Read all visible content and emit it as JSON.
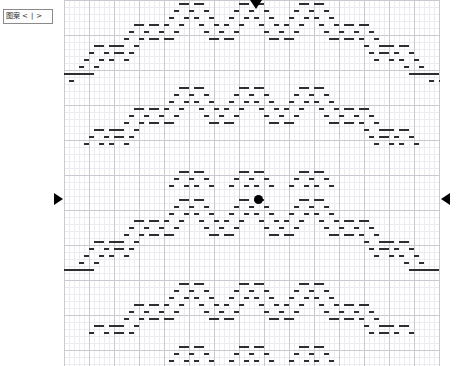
{
  "panel": {
    "pattern_nav": {
      "label": "图案",
      "prev": "<",
      "sep": "|",
      "next": ">"
    }
  },
  "chart": {
    "title": "",
    "grid": {
      "cell_width_px": 5,
      "cell_height_px": 7,
      "major_every_cells": 5,
      "minor_color": "#ececf0",
      "major_color": "#c9c9cf",
      "background": "#ffffff",
      "origin_x_px": 64,
      "origin_y_px": 0,
      "width_px": 376,
      "height_px": 366,
      "cols": 75,
      "rows": 52
    },
    "stitch": {
      "color": "#2e2e32",
      "shape": "horizontal-dash",
      "width_px": 5,
      "height_px": 2
    },
    "markers": {
      "top": {
        "icon": "triangle-down",
        "color": "#000000",
        "x_px": 256,
        "y_px": 5
      },
      "left": {
        "icon": "triangle-right",
        "color": "#000000",
        "x_px": 58,
        "y_px": 199
      },
      "right": {
        "icon": "triangle-left",
        "color": "#000000",
        "x_px": 445,
        "y_px": 199
      },
      "center": {
        "icon": "center-dot",
        "color": "#000000",
        "x_px": 258,
        "y_px": 199
      }
    }
  },
  "chart_data": {
    "type": "heatmap",
    "xlabel": "",
    "ylabel": "",
    "grid": true,
    "legend": "none",
    "cols": 75,
    "rows": 52,
    "symbol": "horizontal-dash",
    "symbol_color": "#2e2e32",
    "filled_cells": [
      [
        26,
        0
      ],
      [
        27,
        0
      ],
      [
        38,
        0
      ],
      [
        39,
        0
      ],
      [
        50,
        0
      ],
      [
        51,
        0
      ],
      [
        25,
        1
      ],
      [
        28,
        1
      ],
      [
        37,
        1
      ],
      [
        40,
        1
      ],
      [
        49,
        1
      ],
      [
        52,
        1
      ],
      [
        24,
        2
      ],
      [
        29,
        2
      ],
      [
        36,
        2
      ],
      [
        41,
        2
      ],
      [
        48,
        2
      ],
      [
        53,
        2
      ],
      [
        17,
        3
      ],
      [
        18,
        3
      ],
      [
        23,
        3
      ],
      [
        30,
        3
      ],
      [
        35,
        3
      ],
      [
        42,
        3
      ],
      [
        47,
        3
      ],
      [
        54,
        3
      ],
      [
        59,
        3
      ],
      [
        60,
        3
      ],
      [
        16,
        4
      ],
      [
        19,
        4
      ],
      [
        22,
        4
      ],
      [
        31,
        4
      ],
      [
        34,
        4
      ],
      [
        43,
        4
      ],
      [
        46,
        4
      ],
      [
        55,
        4
      ],
      [
        58,
        4
      ],
      [
        61,
        4
      ],
      [
        15,
        5
      ],
      [
        20,
        5
      ],
      [
        21,
        5
      ],
      [
        32,
        5
      ],
      [
        33,
        5
      ],
      [
        44,
        5
      ],
      [
        45,
        5
      ],
      [
        56,
        5
      ],
      [
        57,
        5
      ],
      [
        62,
        5
      ],
      [
        9,
        6
      ],
      [
        10,
        6
      ],
      [
        14,
        6
      ],
      [
        63,
        6
      ],
      [
        67,
        6
      ],
      [
        68,
        6
      ],
      [
        8,
        7
      ],
      [
        11,
        7
      ],
      [
        13,
        7
      ],
      [
        64,
        7
      ],
      [
        66,
        7
      ],
      [
        69,
        7
      ],
      [
        7,
        8
      ],
      [
        12,
        8
      ],
      [
        65,
        8
      ],
      [
        70,
        8
      ],
      [
        6,
        9
      ],
      [
        71,
        9
      ],
      [
        2,
        10
      ],
      [
        3,
        10
      ],
      [
        4,
        10
      ],
      [
        5,
        10
      ],
      [
        72,
        10
      ],
      [
        73,
        10
      ],
      [
        74,
        10
      ],
      [
        1,
        11
      ],
      [
        75,
        11
      ],
      [
        26,
        12
      ],
      [
        27,
        12
      ],
      [
        38,
        12
      ],
      [
        39,
        12
      ],
      [
        50,
        12
      ],
      [
        51,
        12
      ],
      [
        25,
        13
      ],
      [
        28,
        13
      ],
      [
        37,
        13
      ],
      [
        40,
        13
      ],
      [
        49,
        13
      ],
      [
        52,
        13
      ],
      [
        24,
        14
      ],
      [
        29,
        14
      ],
      [
        36,
        14
      ],
      [
        41,
        14
      ],
      [
        48,
        14
      ],
      [
        53,
        14
      ],
      [
        17,
        15
      ],
      [
        18,
        15
      ],
      [
        23,
        15
      ],
      [
        30,
        15
      ],
      [
        35,
        15
      ],
      [
        42,
        15
      ],
      [
        47,
        15
      ],
      [
        54,
        15
      ],
      [
        59,
        15
      ],
      [
        60,
        15
      ],
      [
        16,
        16
      ],
      [
        19,
        16
      ],
      [
        22,
        16
      ],
      [
        31,
        16
      ],
      [
        34,
        16
      ],
      [
        43,
        16
      ],
      [
        46,
        16
      ],
      [
        55,
        16
      ],
      [
        58,
        16
      ],
      [
        61,
        16
      ],
      [
        15,
        17
      ],
      [
        20,
        17
      ],
      [
        21,
        17
      ],
      [
        32,
        17
      ],
      [
        33,
        17
      ],
      [
        44,
        17
      ],
      [
        45,
        17
      ],
      [
        56,
        17
      ],
      [
        57,
        17
      ],
      [
        62,
        17
      ],
      [
        9,
        18
      ],
      [
        10,
        18
      ],
      [
        14,
        18
      ],
      [
        63,
        18
      ],
      [
        67,
        18
      ],
      [
        68,
        18
      ],
      [
        8,
        19
      ],
      [
        11,
        19
      ],
      [
        13,
        19
      ],
      [
        64,
        19
      ],
      [
        66,
        19
      ],
      [
        69,
        19
      ],
      [
        7,
        20
      ],
      [
        12,
        20
      ],
      [
        65,
        20
      ],
      [
        70,
        20
      ],
      [
        26,
        24
      ],
      [
        27,
        24
      ],
      [
        38,
        24
      ],
      [
        39,
        24
      ],
      [
        50,
        24
      ],
      [
        51,
        24
      ],
      [
        25,
        25
      ],
      [
        28,
        25
      ],
      [
        37,
        25
      ],
      [
        40,
        25
      ],
      [
        49,
        25
      ],
      [
        52,
        25
      ],
      [
        24,
        26
      ],
      [
        29,
        26
      ],
      [
        36,
        26
      ],
      [
        41,
        26
      ],
      [
        48,
        26
      ],
      [
        53,
        26
      ],
      [
        26,
        28
      ],
      [
        27,
        28
      ],
      [
        38,
        28
      ],
      [
        39,
        28
      ],
      [
        50,
        28
      ],
      [
        51,
        28
      ],
      [
        25,
        29
      ],
      [
        28,
        29
      ],
      [
        37,
        29
      ],
      [
        40,
        29
      ],
      [
        49,
        29
      ],
      [
        52,
        29
      ],
      [
        24,
        30
      ],
      [
        29,
        30
      ],
      [
        36,
        30
      ],
      [
        41,
        30
      ],
      [
        48,
        30
      ],
      [
        53,
        30
      ],
      [
        17,
        31
      ],
      [
        18,
        31
      ],
      [
        23,
        31
      ],
      [
        30,
        31
      ],
      [
        35,
        31
      ],
      [
        42,
        31
      ],
      [
        47,
        31
      ],
      [
        54,
        31
      ],
      [
        59,
        31
      ],
      [
        60,
        31
      ],
      [
        16,
        32
      ],
      [
        19,
        32
      ],
      [
        22,
        32
      ],
      [
        31,
        32
      ],
      [
        34,
        32
      ],
      [
        43,
        32
      ],
      [
        46,
        32
      ],
      [
        55,
        32
      ],
      [
        58,
        32
      ],
      [
        61,
        32
      ],
      [
        15,
        33
      ],
      [
        20,
        33
      ],
      [
        21,
        33
      ],
      [
        32,
        33
      ],
      [
        33,
        33
      ],
      [
        44,
        33
      ],
      [
        45,
        33
      ],
      [
        56,
        33
      ],
      [
        57,
        33
      ],
      [
        62,
        33
      ],
      [
        9,
        34
      ],
      [
        10,
        34
      ],
      [
        14,
        34
      ],
      [
        63,
        34
      ],
      [
        67,
        34
      ],
      [
        68,
        34
      ],
      [
        8,
        35
      ],
      [
        11,
        35
      ],
      [
        13,
        35
      ],
      [
        64,
        35
      ],
      [
        66,
        35
      ],
      [
        69,
        35
      ],
      [
        7,
        36
      ],
      [
        12,
        36
      ],
      [
        65,
        36
      ],
      [
        70,
        36
      ],
      [
        6,
        37
      ],
      [
        71,
        37
      ],
      [
        2,
        38
      ],
      [
        3,
        38
      ],
      [
        4,
        38
      ],
      [
        5,
        38
      ],
      [
        72,
        38
      ],
      [
        73,
        38
      ],
      [
        74,
        38
      ],
      [
        26,
        40
      ],
      [
        27,
        40
      ],
      [
        38,
        40
      ],
      [
        39,
        40
      ],
      [
        50,
        40
      ],
      [
        51,
        40
      ],
      [
        25,
        41
      ],
      [
        28,
        41
      ],
      [
        37,
        41
      ],
      [
        40,
        41
      ],
      [
        49,
        41
      ],
      [
        52,
        41
      ],
      [
        24,
        42
      ],
      [
        29,
        42
      ],
      [
        36,
        42
      ],
      [
        41,
        42
      ],
      [
        48,
        42
      ],
      [
        53,
        42
      ],
      [
        17,
        43
      ],
      [
        18,
        43
      ],
      [
        23,
        43
      ],
      [
        30,
        43
      ],
      [
        35,
        43
      ],
      [
        42,
        43
      ],
      [
        47,
        43
      ],
      [
        54,
        43
      ],
      [
        59,
        43
      ],
      [
        60,
        43
      ],
      [
        16,
        44
      ],
      [
        19,
        44
      ],
      [
        22,
        44
      ],
      [
        31,
        44
      ],
      [
        34,
        44
      ],
      [
        43,
        44
      ],
      [
        46,
        44
      ],
      [
        55,
        44
      ],
      [
        58,
        44
      ],
      [
        61,
        44
      ],
      [
        15,
        45
      ],
      [
        20,
        45
      ],
      [
        21,
        45
      ],
      [
        32,
        45
      ],
      [
        33,
        45
      ],
      [
        44,
        45
      ],
      [
        45,
        45
      ],
      [
        56,
        45
      ],
      [
        57,
        45
      ],
      [
        62,
        45
      ],
      [
        9,
        46
      ],
      [
        10,
        46
      ],
      [
        14,
        46
      ],
      [
        63,
        46
      ],
      [
        67,
        46
      ],
      [
        68,
        46
      ],
      [
        8,
        47
      ],
      [
        11,
        47
      ],
      [
        13,
        47
      ],
      [
        64,
        47
      ],
      [
        66,
        47
      ],
      [
        69,
        47
      ],
      [
        26,
        49
      ],
      [
        27,
        49
      ],
      [
        38,
        49
      ],
      [
        39,
        49
      ],
      [
        50,
        49
      ],
      [
        51,
        49
      ],
      [
        25,
        50
      ],
      [
        28,
        50
      ],
      [
        37,
        50
      ],
      [
        40,
        50
      ],
      [
        49,
        50
      ],
      [
        52,
        50
      ],
      [
        24,
        51
      ],
      [
        29,
        51
      ],
      [
        36,
        51
      ],
      [
        41,
        51
      ],
      [
        48,
        51
      ],
      [
        53,
        51
      ]
    ]
  }
}
